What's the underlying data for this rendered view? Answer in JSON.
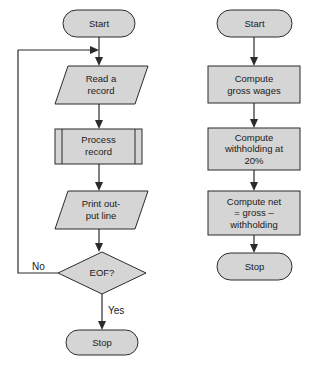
{
  "diagram": {
    "colors": {
      "shape_fill": "#d5d5d5",
      "shape_stroke": "#2b2b2b",
      "connector": "#2b2b2b",
      "text": "#1a1a1a",
      "background": "#ffffff"
    },
    "left_flowchart": {
      "name": "record-processing-loop",
      "nodes": [
        {
          "id": "l-start",
          "shape": "terminator",
          "label": "Start"
        },
        {
          "id": "l-read",
          "shape": "parallelogram-input",
          "label_line1": "Read a",
          "label_line2": "record"
        },
        {
          "id": "l-process",
          "shape": "predefined-process",
          "label_line1": "Process",
          "label_line2": "record"
        },
        {
          "id": "l-print",
          "shape": "parallelogram-output",
          "label_line1": "Print out-",
          "label_line2": "put line"
        },
        {
          "id": "l-eof",
          "shape": "decision",
          "label": "EOF?"
        },
        {
          "id": "l-stop",
          "shape": "terminator",
          "label": "Stop"
        }
      ],
      "branch_labels": {
        "no": "No",
        "yes": "Yes"
      }
    },
    "right_flowchart": {
      "name": "payroll-net-pay",
      "nodes": [
        {
          "id": "r-start",
          "shape": "terminator",
          "label": "Start"
        },
        {
          "id": "r-gross",
          "shape": "process",
          "label_line1": "Compute",
          "label_line2": "gross wages"
        },
        {
          "id": "r-withhold",
          "shape": "process",
          "label_line1": "Compute",
          "label_line2": "withholding at",
          "label_line3": "20%"
        },
        {
          "id": "r-net",
          "shape": "process",
          "label_line1": "Compute net",
          "label_line2": "= gross –",
          "label_line3": "withholding"
        },
        {
          "id": "r-stop",
          "shape": "terminator",
          "label": "Stop"
        }
      ]
    }
  }
}
